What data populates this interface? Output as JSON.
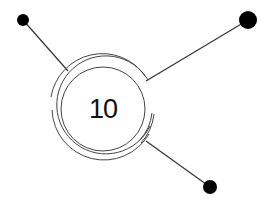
{
  "diagram": {
    "center_node": {
      "label": "10",
      "cx": 103,
      "cy": 109
    },
    "satellites": [
      {
        "name": "top-left",
        "cx": 23,
        "cy": 20,
        "r": 6
      },
      {
        "name": "top-right",
        "cx": 248,
        "cy": 20,
        "r": 9
      },
      {
        "name": "bottom-right",
        "cx": 210,
        "cy": 187,
        "r": 7
      }
    ],
    "colors": {
      "stroke": "#333333",
      "dot": "#000000",
      "background": "#ffffff"
    }
  }
}
